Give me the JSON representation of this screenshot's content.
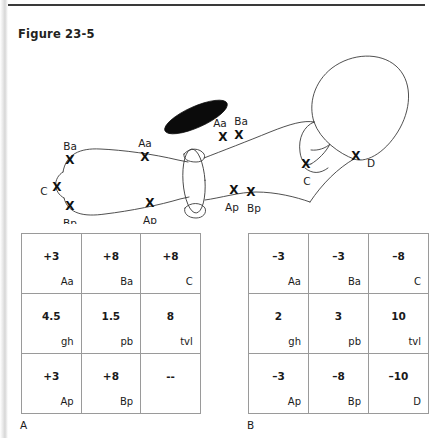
{
  "page": {
    "figure_title": "Figure 23-5",
    "panel_a_letter": "A",
    "panel_b_letter": "B",
    "rule_color": "#3a3a3a",
    "line_color": "#3c3c3c",
    "text_color": "#1a1a1a"
  },
  "diagram": {
    "name": "pelvic-organ-prolapse-sagittal-diagram",
    "marker_glyph": "X",
    "markers": [
      {
        "id": "ba-left",
        "label": "Ba",
        "x": 62,
        "y": 118,
        "label_x": 62,
        "label_y": 104
      },
      {
        "id": "c-left",
        "label": "C",
        "x": 49,
        "y": 145,
        "label_x": 36,
        "label_y": 149
      },
      {
        "id": "bp-left",
        "label": "Bp",
        "x": 62,
        "y": 164,
        "label_x": 62,
        "label_y": 181
      },
      {
        "id": "aa-mid",
        "label": "Aa",
        "x": 137,
        "y": 115,
        "label_x": 137,
        "label_y": 101
      },
      {
        "id": "ap-mid",
        "label": "Ap",
        "x": 142,
        "y": 161,
        "label_x": 142,
        "label_y": 178
      },
      {
        "id": "aa-upper",
        "label": "Aa",
        "x": 215,
        "y": 95,
        "label_x": 212,
        "label_y": 81
      },
      {
        "id": "ba-upper",
        "label": "Ba",
        "x": 231,
        "y": 93,
        "label_x": 233,
        "label_y": 79
      },
      {
        "id": "ap-lower",
        "label": "Ap",
        "x": 226,
        "y": 148,
        "label_x": 224,
        "label_y": 165
      },
      {
        "id": "bp-lower",
        "label": "Bp",
        "x": 243,
        "y": 150,
        "label_x": 246,
        "label_y": 166
      },
      {
        "id": "c-right",
        "label": "C",
        "x": 298,
        "y": 122,
        "label_x": 299,
        "label_y": 139
      },
      {
        "id": "d-right",
        "label": "D",
        "x": 348,
        "y": 114,
        "label_x": 363,
        "label_y": 121
      }
    ]
  },
  "tables": {
    "table_a": {
      "caption": "A",
      "rows": [
        [
          {
            "value": "+3",
            "label": "Aa"
          },
          {
            "value": "+8",
            "label": "Ba"
          },
          {
            "value": "+8",
            "label": "C"
          }
        ],
        [
          {
            "value": "4.5",
            "label": "gh"
          },
          {
            "value": "1.5",
            "label": "pb"
          },
          {
            "value": "8",
            "label": "tvl"
          }
        ],
        [
          {
            "value": "+3",
            "label": "Ap"
          },
          {
            "value": "+8",
            "label": "Bp"
          },
          {
            "value": "--",
            "label": ""
          }
        ]
      ]
    },
    "table_b": {
      "caption": "B",
      "rows": [
        [
          {
            "value": "–3",
            "label": "Aa"
          },
          {
            "value": "–3",
            "label": "Ba"
          },
          {
            "value": "–8",
            "label": "C"
          }
        ],
        [
          {
            "value": "2",
            "label": "gh"
          },
          {
            "value": "3",
            "label": "pb"
          },
          {
            "value": "10",
            "label": "tvl"
          }
        ],
        [
          {
            "value": "–3",
            "label": "Ap"
          },
          {
            "value": "–8",
            "label": "Bp"
          },
          {
            "value": "–10",
            "label": "D"
          }
        ]
      ]
    }
  }
}
